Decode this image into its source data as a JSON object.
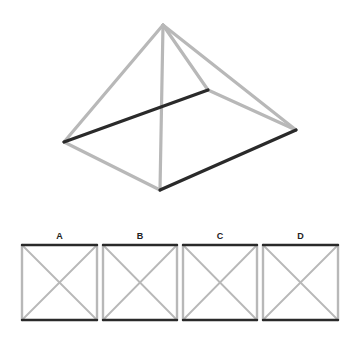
{
  "colors": {
    "background": "#ffffff",
    "light_edge": "#b8b8b8",
    "dark_edge": "#2a2a2a"
  },
  "question_figure": {
    "type": "pyramid-wireframe",
    "vertices": {
      "apex": [
        163,
        25
      ],
      "left": [
        64,
        142
      ],
      "front": [
        160,
        190
      ],
      "right": [
        296,
        130
      ],
      "back": [
        208,
        90
      ]
    },
    "edges": [
      {
        "from": "apex",
        "to": "left",
        "style": "light"
      },
      {
        "from": "apex",
        "to": "front",
        "style": "light"
      },
      {
        "from": "apex",
        "to": "right",
        "style": "light"
      },
      {
        "from": "apex",
        "to": "back",
        "style": "light"
      },
      {
        "from": "left",
        "to": "front",
        "style": "light"
      },
      {
        "from": "back",
        "to": "right",
        "style": "light"
      },
      {
        "from": "left",
        "to": "back",
        "style": "dark"
      },
      {
        "from": "front",
        "to": "right",
        "style": "dark"
      }
    ]
  },
  "options": [
    {
      "label": "A",
      "x": 22,
      "y": 245,
      "w": 75,
      "h": 75,
      "top": "dark",
      "bottom": "dark",
      "left": "light",
      "right": "light"
    },
    {
      "label": "B",
      "x": 103,
      "y": 245,
      "w": 74,
      "h": 75,
      "top": "dark",
      "bottom": "dark",
      "left": "light",
      "right": "light"
    },
    {
      "label": "C",
      "x": 183,
      "y": 245,
      "w": 74,
      "h": 75,
      "top": "dark",
      "bottom": "dark",
      "left": "light",
      "right": "light"
    },
    {
      "label": "D",
      "x": 263,
      "y": 245,
      "w": 75,
      "h": 75,
      "top": "dark",
      "bottom": "dark",
      "left": "light",
      "right": "light"
    }
  ]
}
